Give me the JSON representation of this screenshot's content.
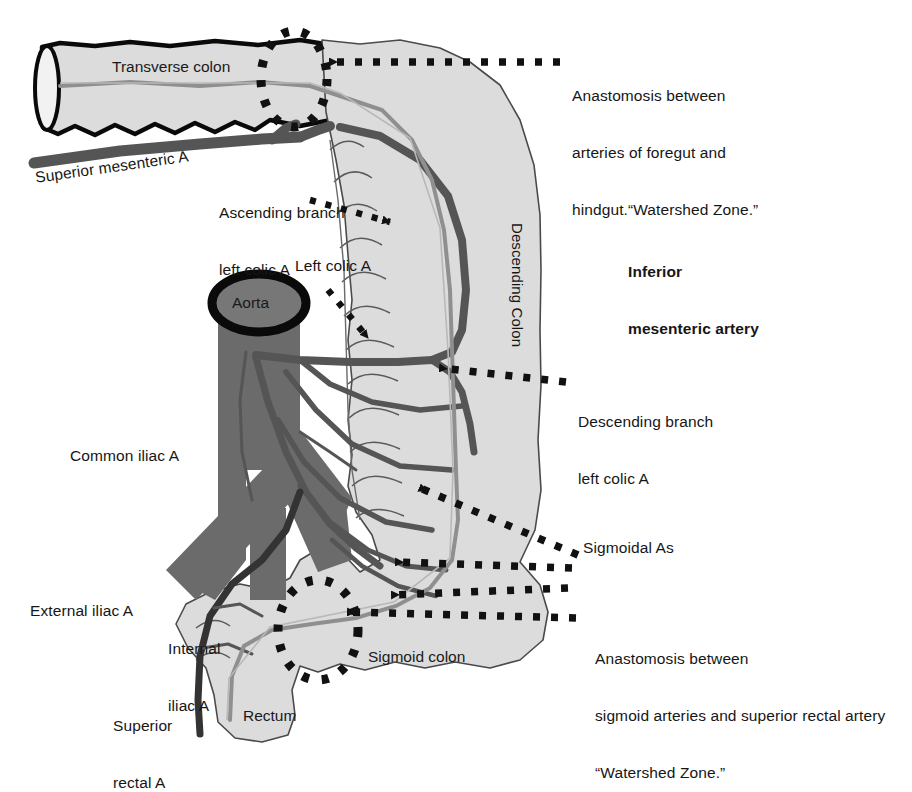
{
  "figure": {
    "background_color": "#ffffff",
    "colors": {
      "colon_fill": "#dcdcdc",
      "colon_outline": "#000000",
      "colon_outline_thin": "#555555",
      "aorta_fill": "#6b6b6b",
      "artery_dark": "#555555",
      "marginal_artery": "#8a8a8a",
      "annotation": "#111111",
      "text": "#161616"
    }
  },
  "organ_labels": [
    {
      "id": "transverse-colon",
      "text": "Transverse colon"
    },
    {
      "id": "descending-colon",
      "text": "Descending Colon"
    },
    {
      "id": "sigmoid-colon",
      "text": "Sigmoid colon"
    },
    {
      "id": "rectum",
      "text": "Rectum"
    },
    {
      "id": "aorta",
      "text": "Aorta"
    }
  ],
  "vessel_labels": [
    {
      "id": "superior-mesenteric-a",
      "text": "Superior mesenteric A"
    },
    {
      "id": "ascending-branch-left-colic-a",
      "line1": "Ascending branch",
      "line2": "left colic A"
    },
    {
      "id": "left-colic-a",
      "text": "Left colic A"
    },
    {
      "id": "common-iliac-a",
      "text": "Common iliac A"
    },
    {
      "id": "external-iliac-a",
      "text": "External iliac A"
    },
    {
      "id": "internal-iliac-a",
      "line1": "Internal",
      "line2": "iliac A"
    },
    {
      "id": "superior-rectal-a",
      "line1": "Superior",
      "line2": "rectal A"
    }
  ],
  "annotations": [
    {
      "id": "inferior-mesenteric-artery",
      "bold": true,
      "lines": [
        "Inferior",
        "mesenteric artery"
      ]
    },
    {
      "id": "anastomosis-foregut-hindgut",
      "bold": false,
      "lines": [
        "Anastomosis between",
        "arteries of foregut and",
        "hindgut.“Watershed Zone.”"
      ]
    },
    {
      "id": "descending-branch-left-colic-a",
      "bold": false,
      "lines": [
        "Descending branch",
        "left colic A"
      ]
    },
    {
      "id": "sigmoidal-as",
      "bold": false,
      "lines": [
        "Sigmoidal As"
      ]
    },
    {
      "id": "anastomosis-sigmoid-superior-rectal",
      "bold": false,
      "lines": [
        "Anastomosis between",
        "sigmoid arteries and superior rectal artery",
        "“Watershed Zone.”"
      ]
    }
  ],
  "watershed_zones": [
    {
      "id": "watershed-zone-splenic-flexure",
      "marker": "dotted-ellipse"
    },
    {
      "id": "watershed-zone-rectosigmoid",
      "marker": "dotted-ellipse"
    }
  ]
}
